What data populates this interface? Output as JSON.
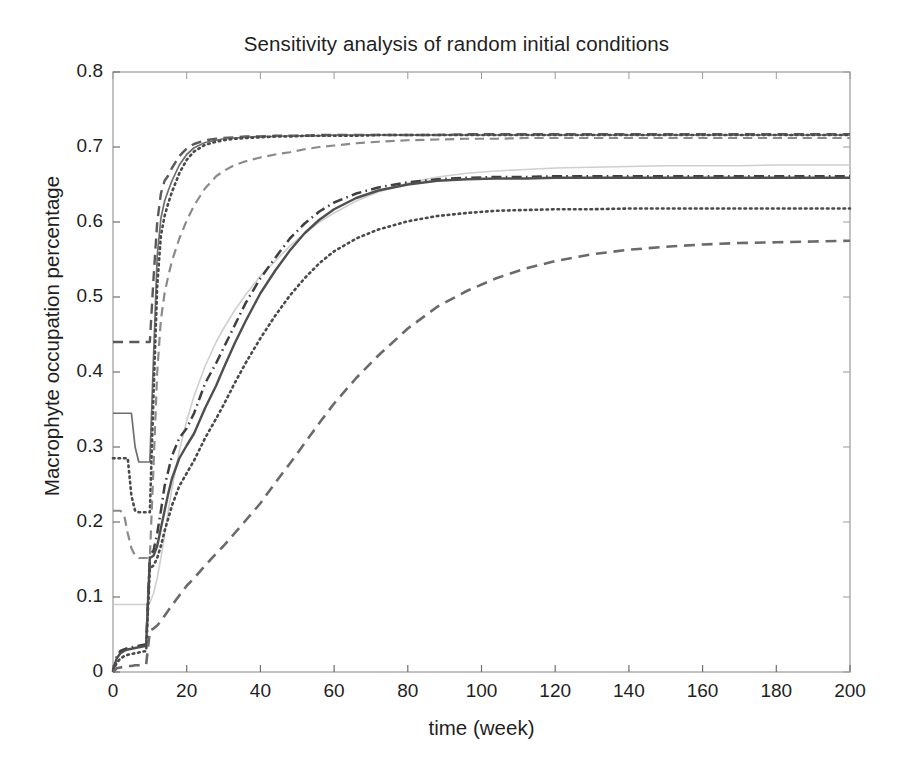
{
  "chart_data": {
    "type": "line",
    "title": "Sensitivity analysis of random initial conditions",
    "xlabel": "time (week)",
    "ylabel": "Macrophyte occupation percentage",
    "xlim": [
      0,
      200
    ],
    "ylim": [
      0,
      0.8
    ],
    "xticks": [
      0,
      20,
      40,
      60,
      80,
      100,
      120,
      140,
      160,
      180,
      200
    ],
    "yticks": [
      "0",
      "0.1",
      "0.2",
      "0.3",
      "0.4",
      "0.5",
      "0.6",
      "0.7",
      "0.8"
    ],
    "ytick_values": [
      0,
      0.1,
      0.2,
      0.3,
      0.4,
      0.5,
      0.6,
      0.7,
      0.8
    ],
    "grid": false,
    "legend": "none",
    "x": [
      0,
      1,
      2,
      3,
      4,
      5,
      6,
      7,
      8,
      9,
      10,
      11,
      12,
      13,
      14,
      15,
      16,
      18,
      20,
      22,
      25,
      28,
      30,
      33,
      36,
      40,
      44,
      48,
      52,
      56,
      60,
      66,
      72,
      80,
      88,
      96,
      104,
      112,
      120,
      130,
      140,
      150,
      160,
      170,
      180,
      190,
      200
    ],
    "series": [
      {
        "name": "run-1",
        "style": "dashed",
        "color": "#5a5a5a",
        "width": 2.4,
        "initial": 0.44,
        "final": 0.717,
        "values": [
          0.44,
          0.44,
          0.44,
          0.44,
          0.44,
          0.44,
          0.44,
          0.44,
          0.44,
          0.44,
          0.44,
          0.525,
          0.6,
          0.638,
          0.655,
          0.662,
          0.672,
          0.688,
          0.698,
          0.704,
          0.709,
          0.711,
          0.712,
          0.713,
          0.714,
          0.714,
          0.715,
          0.715,
          0.715,
          0.716,
          0.716,
          0.716,
          0.716,
          0.716,
          0.716,
          0.717,
          0.717,
          0.717,
          0.717,
          0.717,
          0.717,
          0.717,
          0.717,
          0.717,
          0.717,
          0.717,
          0.717
        ]
      },
      {
        "name": "run-2",
        "style": "solid",
        "color": "#6e6e6e",
        "width": 1.7,
        "initial": 0.345,
        "final": 0.716,
        "values": [
          0.345,
          0.345,
          0.345,
          0.345,
          0.345,
          0.345,
          0.3,
          0.28,
          0.28,
          0.28,
          0.28,
          0.42,
          0.555,
          0.605,
          0.628,
          0.642,
          0.655,
          0.676,
          0.69,
          0.699,
          0.706,
          0.709,
          0.711,
          0.712,
          0.713,
          0.714,
          0.714,
          0.715,
          0.715,
          0.715,
          0.716,
          0.716,
          0.716,
          0.716,
          0.716,
          0.716,
          0.716,
          0.716,
          0.716,
          0.716,
          0.716,
          0.716,
          0.716,
          0.716,
          0.716,
          0.716,
          0.716
        ]
      },
      {
        "name": "run-3",
        "style": "dotted",
        "color": "#4a4a4a",
        "width": 2.6,
        "initial": 0.285,
        "final": 0.716,
        "values": [
          0.285,
          0.285,
          0.285,
          0.285,
          0.285,
          0.235,
          0.215,
          0.213,
          0.213,
          0.213,
          0.213,
          0.37,
          0.515,
          0.582,
          0.608,
          0.625,
          0.64,
          0.665,
          0.683,
          0.694,
          0.703,
          0.707,
          0.709,
          0.711,
          0.712,
          0.713,
          0.714,
          0.714,
          0.715,
          0.715,
          0.715,
          0.715,
          0.716,
          0.716,
          0.716,
          0.716,
          0.716,
          0.716,
          0.716,
          0.716,
          0.716,
          0.716,
          0.716,
          0.716,
          0.716,
          0.716,
          0.716
        ]
      },
      {
        "name": "run-4",
        "style": "dashed",
        "color": "#8a8a8a",
        "width": 2.2,
        "initial": 0.215,
        "final": 0.712,
        "values": [
          0.215,
          0.215,
          0.215,
          0.21,
          0.185,
          0.165,
          0.155,
          0.152,
          0.152,
          0.152,
          0.152,
          0.275,
          0.4,
          0.47,
          0.505,
          0.528,
          0.548,
          0.578,
          0.602,
          0.622,
          0.645,
          0.661,
          0.668,
          0.676,
          0.681,
          0.686,
          0.69,
          0.693,
          0.697,
          0.7,
          0.702,
          0.705,
          0.707,
          0.709,
          0.71,
          0.711,
          0.711,
          0.712,
          0.712,
          0.712,
          0.712,
          0.712,
          0.712,
          0.712,
          0.712,
          0.712,
          0.712
        ]
      },
      {
        "name": "run-5",
        "style": "solid",
        "color": "#cfcfcf",
        "width": 1.6,
        "initial": 0.09,
        "final": 0.676,
        "values": [
          0.09,
          0.09,
          0.09,
          0.09,
          0.09,
          0.09,
          0.09,
          0.09,
          0.09,
          0.09,
          0.092,
          0.105,
          0.125,
          0.152,
          0.182,
          0.215,
          0.245,
          0.295,
          0.335,
          0.368,
          0.408,
          0.44,
          0.458,
          0.482,
          0.503,
          0.528,
          0.548,
          0.568,
          0.585,
          0.6,
          0.612,
          0.628,
          0.64,
          0.652,
          0.66,
          0.665,
          0.668,
          0.67,
          0.672,
          0.673,
          0.674,
          0.675,
          0.675,
          0.675,
          0.676,
          0.676,
          0.676
        ]
      },
      {
        "name": "run-6",
        "style": "dashdot",
        "color": "#3f3f3f",
        "width": 2.5,
        "initial": 0.035,
        "final": 0.661,
        "values": [
          0.0,
          0.02,
          0.028,
          0.03,
          0.032,
          0.033,
          0.034,
          0.035,
          0.036,
          0.037,
          0.155,
          0.162,
          0.185,
          0.215,
          0.248,
          0.268,
          0.288,
          0.312,
          0.325,
          0.345,
          0.385,
          0.412,
          0.432,
          0.462,
          0.492,
          0.525,
          0.552,
          0.578,
          0.598,
          0.614,
          0.626,
          0.638,
          0.646,
          0.653,
          0.657,
          0.659,
          0.66,
          0.66,
          0.661,
          0.661,
          0.661,
          0.661,
          0.661,
          0.661,
          0.661,
          0.661,
          0.661
        ]
      },
      {
        "name": "run-7",
        "style": "solid",
        "color": "#4f4f4f",
        "width": 2.4,
        "initial": 0.03,
        "final": 0.659,
        "values": [
          0.003,
          0.018,
          0.025,
          0.028,
          0.03,
          0.031,
          0.032,
          0.033,
          0.034,
          0.035,
          0.152,
          0.155,
          0.168,
          0.192,
          0.215,
          0.238,
          0.258,
          0.285,
          0.302,
          0.318,
          0.352,
          0.382,
          0.405,
          0.438,
          0.468,
          0.505,
          0.535,
          0.562,
          0.585,
          0.603,
          0.617,
          0.632,
          0.642,
          0.65,
          0.655,
          0.657,
          0.658,
          0.658,
          0.659,
          0.659,
          0.659,
          0.659,
          0.659,
          0.659,
          0.659,
          0.659,
          0.659
        ]
      },
      {
        "name": "run-8",
        "style": "dotted",
        "color": "#4a4a4a",
        "width": 2.6,
        "initial": 0.025,
        "final": 0.618,
        "values": [
          0.002,
          0.012,
          0.018,
          0.021,
          0.023,
          0.024,
          0.025,
          0.026,
          0.027,
          0.028,
          0.138,
          0.142,
          0.152,
          0.168,
          0.188,
          0.205,
          0.222,
          0.248,
          0.265,
          0.282,
          0.312,
          0.338,
          0.356,
          0.385,
          0.412,
          0.445,
          0.475,
          0.502,
          0.525,
          0.545,
          0.561,
          0.578,
          0.59,
          0.601,
          0.608,
          0.612,
          0.615,
          0.616,
          0.617,
          0.617,
          0.618,
          0.618,
          0.618,
          0.618,
          0.618,
          0.618,
          0.618
        ]
      },
      {
        "name": "run-9",
        "style": "dashed",
        "color": "#6a6a6a",
        "width": 2.6,
        "initial": 0.008,
        "final": 0.575,
        "values": [
          0.0,
          0.005,
          0.006,
          0.007,
          0.008,
          0.008,
          0.009,
          0.009,
          0.01,
          0.01,
          0.055,
          0.058,
          0.062,
          0.068,
          0.075,
          0.082,
          0.089,
          0.102,
          0.115,
          0.125,
          0.142,
          0.158,
          0.168,
          0.185,
          0.202,
          0.225,
          0.252,
          0.278,
          0.305,
          0.332,
          0.358,
          0.392,
          0.422,
          0.458,
          0.487,
          0.508,
          0.525,
          0.538,
          0.548,
          0.557,
          0.563,
          0.567,
          0.57,
          0.572,
          0.573,
          0.574,
          0.575
        ]
      }
    ]
  }
}
